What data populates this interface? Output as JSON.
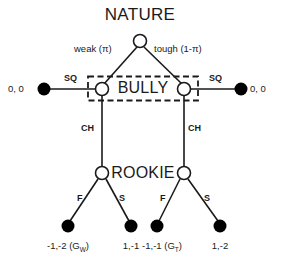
{
  "figure": {
    "type": "extensive-form-game-tree",
    "title": "NATURE"
  },
  "players": {
    "nature": "NATURE",
    "bully": "BULLY",
    "rookie": "ROOKIE"
  },
  "nature_branches": [
    {
      "label": "weak (π)"
    },
    {
      "label": "tough (1-π)"
    }
  ],
  "bully_branches": {
    "sq_left": "SQ",
    "sq_right": "SQ",
    "ch_left": "CH",
    "ch_right": "CH"
  },
  "rookie_branches": {
    "f_left": "F",
    "s_left": "S",
    "f_right": "F",
    "s_right": "S"
  },
  "payoffs": {
    "sq_left": "0, 0",
    "sq_right": "0, 0",
    "f_left_main": "-1,-2 (G",
    "f_left_sub": "W",
    "f_left_end": ")",
    "s_left": "1,-1",
    "f_right_main": "-1,-1 (G",
    "f_right_sub": "T",
    "f_right_end": ")",
    "s_right": "1,-2"
  },
  "colors": {
    "line": "#1a1a1a",
    "node_fill": "#ffffff",
    "terminal_fill": "#000000",
    "text": "#1a1a1a",
    "background": "#ffffff"
  },
  "nodes": {
    "nature": {
      "x": 140,
      "y": 41
    },
    "bully_left": {
      "x": 102,
      "y": 89
    },
    "bully_right": {
      "x": 184,
      "y": 89
    },
    "rookie_left": {
      "x": 102,
      "y": 173
    },
    "rookie_right": {
      "x": 184,
      "y": 173
    },
    "terminal_sq_left": {
      "x": 44,
      "y": 89
    },
    "terminal_sq_right": {
      "x": 241,
      "y": 89
    },
    "terminal_f_left": {
      "x": 68,
      "y": 226
    },
    "terminal_s_left": {
      "x": 131,
      "y": 226
    },
    "terminal_f_right": {
      "x": 157,
      "y": 226
    },
    "terminal_s_right": {
      "x": 220,
      "y": 226
    }
  },
  "information_set": {
    "label": "BULLY",
    "style": "dashed-rectangle",
    "x": 88,
    "y": 76,
    "width": 110,
    "height": 25
  }
}
